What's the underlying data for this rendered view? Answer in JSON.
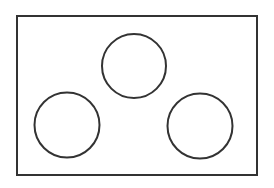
{
  "diagram": {
    "stroke_color": "#333333",
    "background_color": "#ffffff",
    "frame": {
      "x": 17,
      "y": 16,
      "width": 240,
      "height": 159,
      "stroke_width": 2
    },
    "circles": [
      {
        "name": "top-circle",
        "cx": 134,
        "cy": 66,
        "r": 32,
        "stroke_width": 2
      },
      {
        "name": "bottom-left-circle",
        "cx": 67,
        "cy": 125,
        "r": 32.5,
        "stroke_width": 2
      },
      {
        "name": "bottom-right-circle",
        "cx": 200,
        "cy": 126,
        "r": 32.5,
        "stroke_width": 2
      }
    ]
  }
}
